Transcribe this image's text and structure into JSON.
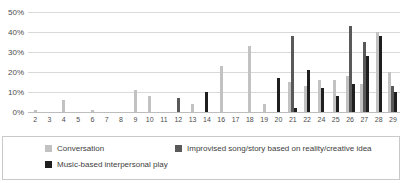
{
  "chart_data": {
    "type": "bar",
    "categories": [
      "2",
      "3",
      "4",
      "5",
      "6",
      "7",
      "8",
      "9",
      "10",
      "11",
      "12",
      "13",
      "14",
      "16",
      "17",
      "18",
      "19",
      "20",
      "21",
      "22",
      "24",
      "25",
      "26",
      "27",
      "28",
      "29"
    ],
    "series": [
      {
        "name": "Conversation",
        "color": "#c2c2c2",
        "values": [
          1,
          0,
          6,
          0,
          1,
          0,
          0,
          11,
          8,
          0,
          0,
          4,
          0,
          23,
          0,
          33,
          4,
          0,
          15,
          13,
          16,
          16,
          18,
          14,
          40,
          20
        ]
      },
      {
        "name": "Improvised song/story based on reality/creative idea",
        "color": "#595959",
        "values": [
          0,
          0,
          0,
          0,
          0,
          0,
          0,
          0,
          0,
          0,
          7,
          0,
          0,
          0,
          0,
          0,
          0,
          0,
          38,
          0,
          0,
          0,
          43,
          35,
          0,
          13
        ]
      },
      {
        "name": "Music-based interpersonal play",
        "color": "#1f1f1f",
        "values": [
          0,
          0,
          0,
          0,
          0,
          0,
          0,
          0,
          0,
          0,
          0,
          0,
          10,
          0,
          0,
          0,
          0,
          17,
          2,
          21,
          12,
          8,
          14,
          28,
          38,
          10
        ]
      }
    ],
    "title": "",
    "xlabel": "",
    "ylabel": "",
    "ylim": [
      0,
      50
    ],
    "y_ticks": [
      "0%",
      "10%",
      "20%",
      "30%",
      "40%",
      "50%"
    ],
    "grid": true,
    "legend_position": "bottom-box"
  },
  "legend": {
    "items": [
      {
        "label": "Conversation",
        "color": "#c2c2c2"
      },
      {
        "label": "Improvised song/story based on reality/creative idea",
        "color": "#595959"
      },
      {
        "label": "Music-based interpersonal play",
        "color": "#1f1f1f"
      }
    ]
  }
}
